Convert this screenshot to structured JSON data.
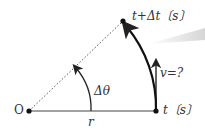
{
  "diagram": {
    "origin_label": "O",
    "radius_label": "r",
    "angle_label": "Δθ",
    "velocity_label": "v=?",
    "start_time_label": "t〔s〕",
    "end_time_label": "t+Δt〔s〕",
    "colors": {
      "line": "#222222",
      "dotted": "#555555",
      "highlight": "#dddddd"
    }
  }
}
